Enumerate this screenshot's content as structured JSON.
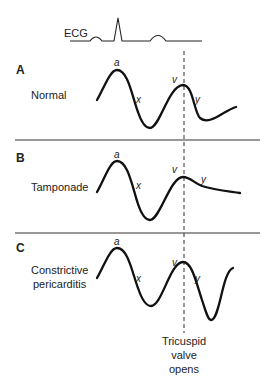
{
  "ecg": {
    "label": "ECG"
  },
  "panels": [
    {
      "letter": "A",
      "condition_lines": [
        "Normal"
      ],
      "wave_labels": {
        "a": "a",
        "x": "x",
        "v": "v",
        "y": "y"
      }
    },
    {
      "letter": "B",
      "condition_lines": [
        "Tamponade"
      ],
      "wave_labels": {
        "a": "a",
        "x": "x",
        "v": "v",
        "y": "y"
      }
    },
    {
      "letter": "C",
      "condition_lines": [
        "Constrictive",
        "pericarditis"
      ],
      "wave_labels": {
        "a": "a",
        "x": "x",
        "v": "v",
        "y": "y"
      }
    }
  ],
  "marker": {
    "label_lines": [
      "Tricuspid",
      "valve",
      "opens"
    ]
  }
}
